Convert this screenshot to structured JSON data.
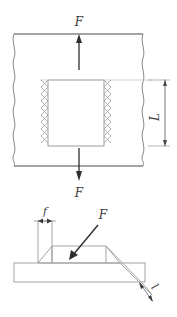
{
  "figure": {
    "line_color": "#8a8a8a",
    "heavy_line_color": "#4a4a4a",
    "arrow_color": "#2e2e2e",
    "label_color": "#3a3a3a",
    "background": "#ffffff"
  },
  "plan_view": {
    "name": "plan-view-of-welded-joint",
    "force_top_label": "F",
    "force_bottom_label": "F",
    "length_label": "L",
    "weld_symbol": "zigzag-weld-hatch",
    "break_line_symbol": "wavy-break-line"
  },
  "iso_view": {
    "name": "isometric-view-of-fillet-weld",
    "thickness_label": "f",
    "force_label": "F",
    "leg_label": "l"
  }
}
